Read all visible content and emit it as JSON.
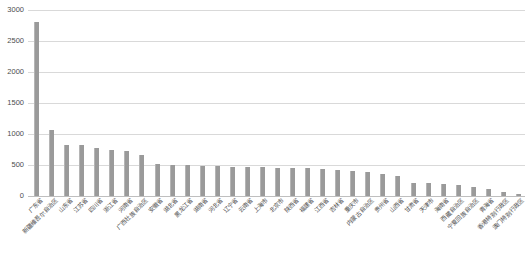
{
  "chart_data": {
    "type": "bar",
    "title": "",
    "xlabel": "",
    "ylabel": "",
    "ylim": [
      0,
      3000
    ],
    "grid": true,
    "legend": "none",
    "yticks": [
      0,
      500,
      1000,
      1500,
      2000,
      2500,
      3000
    ],
    "ytick_labels": [
      "0",
      "500",
      "1000",
      "1500",
      "2000",
      "2500",
      "3000"
    ],
    "bar_color": "#9a9a9a",
    "gridline_color": "#d9d9d9",
    "categories": [
      "广东省",
      "新疆维吾尔自治区",
      "山东省",
      "江苏省",
      "四川省",
      "浙江省",
      "河南省",
      "广西壮族自治区",
      "安徽省",
      "湖北省",
      "黑龙江省",
      "湖南省",
      "河北省",
      "辽宁省",
      "云南省",
      "上海市",
      "北京市",
      "陕西省",
      "福建省",
      "江西省",
      "吉林省",
      "重庆市",
      "内蒙古自治区",
      "贵州省",
      "山西省",
      "甘肃省",
      "天津市",
      "海南省",
      "西藏自治区",
      "宁夏回族自治区",
      "青海省",
      "香港特别行政区",
      "澳门特别行政区"
    ],
    "values": [
      2810,
      1070,
      830,
      825,
      770,
      740,
      720,
      665,
      520,
      505,
      495,
      490,
      480,
      475,
      470,
      465,
      455,
      450,
      445,
      430,
      415,
      400,
      390,
      350,
      320,
      215,
      205,
      200,
      185,
      145,
      110,
      60,
      35
    ]
  }
}
